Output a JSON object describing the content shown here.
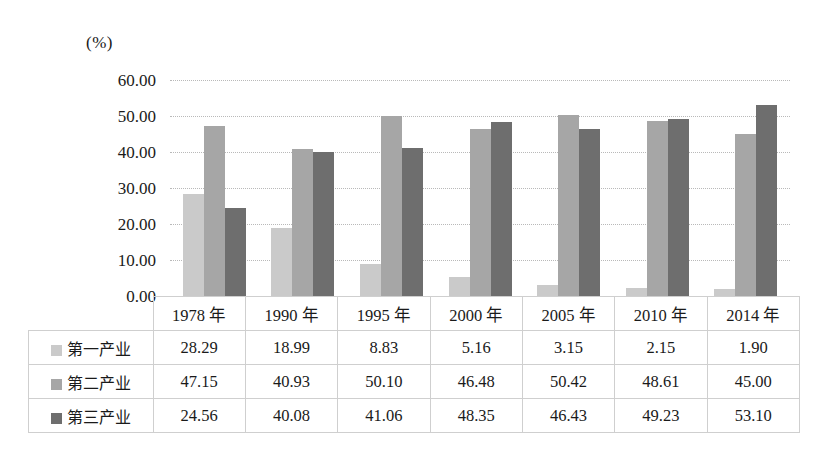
{
  "chart_data": {
    "type": "bar",
    "title": "",
    "subtitle": "",
    "xlabel": "",
    "ylabel": "",
    "unit_label": "(%)",
    "categories": [
      "1978 年",
      "1990 年",
      "1995 年",
      "2000 年",
      "2005 年",
      "2010 年",
      "2014 年"
    ],
    "series": [
      {
        "name": "第一产业",
        "color": "#cacaca",
        "values": [
          28.29,
          18.99,
          8.83,
          5.16,
          3.15,
          2.15,
          1.9
        ]
      },
      {
        "name": "第二产业",
        "color": "#a6a6a6",
        "values": [
          47.15,
          40.93,
          50.1,
          46.48,
          50.42,
          48.61,
          45.0
        ]
      },
      {
        "name": "第三产业",
        "color": "#6e6e6e",
        "values": [
          24.56,
          40.08,
          41.06,
          48.35,
          46.43,
          49.23,
          53.1
        ]
      }
    ],
    "ylim": [
      0,
      60
    ],
    "ytick_values": [
      60,
      50,
      40,
      30,
      20,
      10,
      0
    ],
    "ytick_labels": [
      "60.00",
      "50.00",
      "40.00",
      "30.00",
      "20.00",
      "10.00",
      "0.00"
    ],
    "grid": true,
    "legend_position": "table-row-headers",
    "value_format": "2dp"
  },
  "table": {
    "corner_label": "",
    "column_headers": [
      "1978 年",
      "1990 年",
      "1995 年",
      "2000 年",
      "2005 年",
      "2010 年",
      "2014 年"
    ],
    "rows": [
      {
        "label": "第一产业",
        "swatch": "#cacaca",
        "cells": [
          "28.29",
          "18.99",
          "8.83",
          "5.16",
          "3.15",
          "2.15",
          "1.90"
        ]
      },
      {
        "label": "第二产业",
        "swatch": "#a6a6a6",
        "cells": [
          "47.15",
          "40.93",
          "50.10",
          "46.48",
          "50.42",
          "48.61",
          "45.00"
        ]
      },
      {
        "label": "第三产业",
        "swatch": "#6e6e6e",
        "cells": [
          "24.56",
          "40.08",
          "41.06",
          "48.35",
          "46.43",
          "49.23",
          "53.10"
        ]
      }
    ]
  }
}
